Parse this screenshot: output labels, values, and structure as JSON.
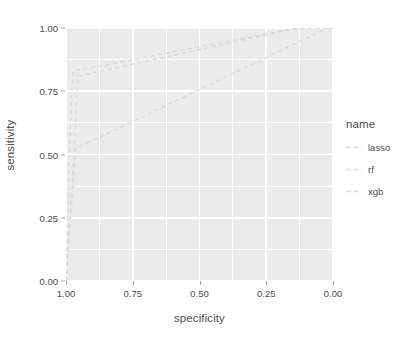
{
  "chart_data": {
    "type": "line",
    "title": "",
    "subtitle": "",
    "xlabel": "specificity",
    "ylabel": "sensitivity",
    "xlim": [
      1.0,
      0.0
    ],
    "x_reversed": true,
    "ylim": [
      0.0,
      1.0
    ],
    "grid": true,
    "x_ticks": [
      "1.00",
      "0.75",
      "0.50",
      "0.25",
      "0.00"
    ],
    "x_tick_values": [
      1.0,
      0.75,
      0.5,
      0.25,
      0.0
    ],
    "y_ticks": [
      "0.00",
      "0.25",
      "0.50",
      "0.75",
      "1.00"
    ],
    "y_tick_values": [
      0.0,
      0.25,
      0.5,
      0.75,
      1.0
    ],
    "legend_position": "right",
    "legend_title": "name",
    "panel_background": "#ebebeb",
    "grid_color": "#ffffff",
    "line_color": "#d9d9d9",
    "line_dash": "dashed",
    "series": [
      {
        "name": "lasso",
        "color": "#d9d9d9",
        "x": [
          1.0,
          0.987,
          0.977,
          0.973,
          0.135,
          0.0
        ],
        "y": [
          0.0,
          0.51,
          0.79,
          0.83,
          1.0,
          1.0
        ]
      },
      {
        "name": "rf",
        "color": "#d9d9d9",
        "x": [
          1.0,
          0.968,
          0.958,
          0.954,
          0.13,
          0.0
        ],
        "y": [
          0.0,
          0.53,
          0.77,
          0.81,
          1.0,
          1.0
        ]
      },
      {
        "name": "xgb",
        "color": "#d9d9d9",
        "x": [
          1.0,
          0.963,
          0.906,
          0.02,
          0.0
        ],
        "y": [
          0.0,
          0.525,
          0.552,
          1.0,
          1.0
        ]
      }
    ]
  },
  "axes": {
    "x_title": "specificity",
    "y_title": "sensitivity"
  },
  "legend": {
    "title": "name",
    "items": [
      {
        "label": "lasso",
        "color": "#d9d9d9"
      },
      {
        "label": "rf",
        "color": "#d9d9d9"
      },
      {
        "label": "xgb",
        "color": "#d9d9d9"
      }
    ]
  }
}
